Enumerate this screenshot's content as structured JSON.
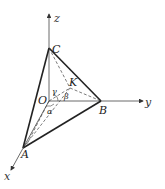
{
  "diagram": {
    "type": "3d-tetrahedron-coordinate-figure",
    "axes": {
      "x": "x",
      "y": "y",
      "z": "z"
    },
    "points": {
      "O": "O",
      "A": "A",
      "B": "B",
      "C": "C",
      "K": "K"
    },
    "angles": {
      "alpha": "α",
      "beta": "β",
      "gamma": "γ"
    },
    "colors": {
      "stroke": "#222222",
      "axis": "#444444"
    }
  }
}
